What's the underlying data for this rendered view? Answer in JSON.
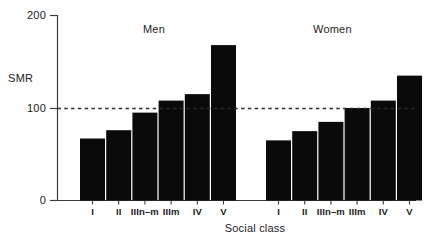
{
  "chart_data": {
    "type": "bar",
    "title": "",
    "xlabel": "Social class",
    "ylabel": "SMR",
    "ylim": [
      0,
      200
    ],
    "yticks": [
      0,
      100,
      200
    ],
    "ytick_labels": [
      "0",
      "100",
      "200"
    ],
    "grid": false,
    "legend": "none",
    "reference_line": {
      "value": 100,
      "style": "dashed",
      "label": ""
    },
    "categories": [
      "I",
      "II",
      "IIIn-m",
      "IIIm",
      "IV",
      "V"
    ],
    "groups": [
      {
        "name": "Men",
        "values": [
          67,
          76,
          95,
          108,
          115,
          168
        ]
      },
      {
        "name": "Women",
        "values": [
          65,
          75,
          85,
          100,
          108,
          135
        ]
      }
    ],
    "series": [
      {
        "name": "Men",
        "values": [
          67,
          76,
          95,
          108,
          115,
          168
        ]
      },
      {
        "name": "Women",
        "values": [
          65,
          75,
          85,
          100,
          108,
          135
        ]
      }
    ],
    "bar_color": "#0a0a0a",
    "axis_color": "#3c3c3c"
  },
  "axis": {
    "y_title": "SMR",
    "x_title": "Social class",
    "tick_200": "200",
    "tick_100": "100",
    "tick_0": "0"
  },
  "groups": {
    "men_label": "Men",
    "women_label": "Women"
  },
  "categories": {
    "c0": "I",
    "c1": "II",
    "c2": "IIIn–m",
    "c3": "IIIm",
    "c4": "IV",
    "c5": "V"
  }
}
